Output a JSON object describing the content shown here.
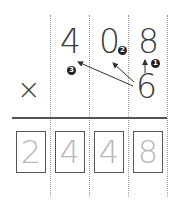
{
  "problem": {
    "multiplicand_digits": [
      "4",
      "0",
      "8"
    ],
    "multiplier": "6",
    "operator": "×",
    "result_digits": [
      "2",
      "4",
      "4",
      "8"
    ]
  },
  "steps": [
    {
      "badge": "1",
      "target": "8"
    },
    {
      "badge": "2",
      "target": "0"
    },
    {
      "badge": "3",
      "target": "4"
    }
  ],
  "colors": {
    "digit": "#3a3a3a",
    "result": "#b8b8b8",
    "box_border": "#555555",
    "grid_line": "#9a9a9a",
    "badge": "#222222"
  }
}
